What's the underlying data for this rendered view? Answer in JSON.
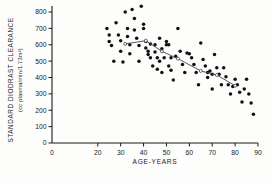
{
  "figure": {
    "name": "diodrast-clearance-vs-age-scatter",
    "background": "#fdfdfc",
    "ink_color": "#1a1a1a",
    "point_color": "#111111",
    "trend_color": "#444444"
  },
  "axes": {
    "y_title_line1": "STANDARD  DIODRAST  CLEARANCE",
    "y_title_line2": "(cc plasma/min/1.73m²)",
    "x_title": "AGE-YEARS",
    "y_ticks": [
      0,
      100,
      200,
      300,
      400,
      500,
      600,
      700,
      800
    ],
    "y_tick_labels": [
      "0",
      "100",
      "200",
      "300",
      "400",
      "500",
      "600",
      "700",
      "800"
    ],
    "x_ticks": [
      0,
      20,
      30,
      40,
      50,
      60,
      70,
      80,
      90
    ],
    "x_tick_labels": [
      "0",
      "20",
      "30",
      "40",
      "50",
      "60",
      "70",
      "80",
      "90"
    ]
  },
  "chart_data": {
    "type": "scatter",
    "title": "",
    "xlabel": "AGE-YEARS",
    "ylabel": "STANDARD DIODRAST CLEARANCE (cc plasma/min/1.73m²)",
    "xlim": [
      0,
      90
    ],
    "ylim": [
      0,
      850
    ],
    "grid": false,
    "legend": "none",
    "series": [
      {
        "name": "Individual subjects",
        "marker": "filled-circle",
        "color": "#111111",
        "points": [
          [
            24,
            700
          ],
          [
            25,
            660
          ],
          [
            25,
            620
          ],
          [
            26,
            595
          ],
          [
            27,
            500
          ],
          [
            28,
            735
          ],
          [
            29,
            660
          ],
          [
            30,
            625
          ],
          [
            30,
            560
          ],
          [
            31,
            495
          ],
          [
            32,
            800
          ],
          [
            33,
            700
          ],
          [
            33,
            650
          ],
          [
            34,
            600
          ],
          [
            34,
            545
          ],
          [
            35,
            815
          ],
          [
            36,
            760
          ],
          [
            36,
            690
          ],
          [
            37,
            640
          ],
          [
            38,
            595
          ],
          [
            38,
            500
          ],
          [
            39,
            835
          ],
          [
            40,
            725
          ],
          [
            40,
            700
          ],
          [
            41,
            620
          ],
          [
            41,
            580
          ],
          [
            42,
            560
          ],
          [
            42,
            540
          ],
          [
            43,
            605
          ],
          [
            43,
            520
          ],
          [
            44,
            470
          ],
          [
            45,
            600
          ],
          [
            45,
            555
          ],
          [
            46,
            520
          ],
          [
            46,
            450
          ],
          [
            47,
            640
          ],
          [
            47,
            500
          ],
          [
            48,
            575
          ],
          [
            48,
            430
          ],
          [
            49,
            520
          ],
          [
            50,
            620
          ],
          [
            50,
            600
          ],
          [
            51,
            600
          ],
          [
            51,
            470
          ],
          [
            52,
            520
          ],
          [
            52,
            445
          ],
          [
            53,
            385
          ],
          [
            54,
            530
          ],
          [
            55,
            700
          ],
          [
            56,
            560
          ],
          [
            57,
            480
          ],
          [
            58,
            430
          ],
          [
            59,
            550
          ],
          [
            60,
            545
          ],
          [
            61,
            520
          ],
          [
            62,
            480
          ],
          [
            63,
            430
          ],
          [
            64,
            355
          ],
          [
            65,
            610
          ],
          [
            66,
            510
          ],
          [
            67,
            470
          ],
          [
            68,
            430
          ],
          [
            68,
            400
          ],
          [
            69,
            440
          ],
          [
            70,
            420
          ],
          [
            70,
            330
          ],
          [
            71,
            540
          ],
          [
            72,
            460
          ],
          [
            73,
            420
          ],
          [
            74,
            355
          ],
          [
            75,
            460
          ],
          [
            76,
            405
          ],
          [
            77,
            355
          ],
          [
            78,
            300
          ],
          [
            79,
            345
          ],
          [
            80,
            390
          ],
          [
            81,
            355
          ],
          [
            82,
            310
          ],
          [
            83,
            250
          ],
          [
            84,
            330
          ],
          [
            85,
            390
          ],
          [
            86,
            300
          ],
          [
            87,
            245
          ],
          [
            88,
            175
          ]
        ]
      }
    ],
    "trend": {
      "name": "Mean by age group",
      "marker": "open-circle",
      "color": "#444444",
      "points": [
        [
          32,
          605
        ],
        [
          41,
          625
        ],
        [
          48,
          560
        ],
        [
          55,
          515
        ],
        [
          65,
          440
        ],
        [
          72,
          415
        ],
        [
          80,
          350
        ]
      ]
    }
  }
}
